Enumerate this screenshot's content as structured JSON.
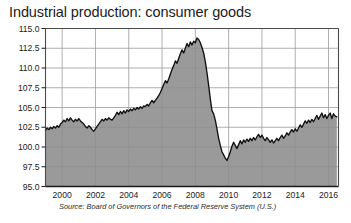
{
  "chart_data": {
    "type": "area",
    "title": "Industrial production: consumer goods",
    "xlabel": "",
    "ylabel": "",
    "source": "Source: Board of Governors of the Federal Reserve System (U.S.)",
    "grid": true,
    "legend": "none",
    "xlim": [
      1999.0,
      2016.6
    ],
    "ylim": [
      95.0,
      115.0
    ],
    "yticks": [
      "95.0",
      "97.5",
      "100.0",
      "102.5",
      "105.0",
      "107.5",
      "110.0",
      "112.5",
      "115.0"
    ],
    "ytick_values": [
      95.0,
      97.5,
      100.0,
      102.5,
      105.0,
      107.5,
      110.0,
      112.5,
      115.0
    ],
    "xticks": [
      "2000",
      "2002",
      "2004",
      "2006",
      "2008",
      "2010",
      "2012",
      "2014",
      "2016"
    ],
    "xtick_values": [
      2000,
      2002,
      2004,
      2006,
      2008,
      2010,
      2012,
      2014,
      2016
    ],
    "colors": {
      "area_fill": "#8c8c8c",
      "line": "#101010",
      "grid": "#9a9a9a",
      "axis": "#4a4a4a",
      "background": "#ffffff",
      "title_text": "#1c1c1c"
    },
    "series": [
      {
        "name": "Industrial production: consumer goods",
        "x": [
          1999.0,
          1999.1,
          1999.2,
          1999.3,
          1999.4,
          1999.5,
          1999.6,
          1999.7,
          1999.8,
          1999.9,
          2000.0,
          2000.1,
          2000.2,
          2000.3,
          2000.4,
          2000.5,
          2000.6,
          2000.7,
          2000.8,
          2000.9,
          2001.0,
          2001.1,
          2001.2,
          2001.3,
          2001.4,
          2001.5,
          2001.6,
          2001.7,
          2001.8,
          2001.9,
          2002.0,
          2002.1,
          2002.2,
          2002.3,
          2002.4,
          2002.5,
          2002.6,
          2002.7,
          2002.8,
          2002.9,
          2003.0,
          2003.1,
          2003.2,
          2003.3,
          2003.4,
          2003.5,
          2003.6,
          2003.7,
          2003.8,
          2003.9,
          2004.0,
          2004.1,
          2004.2,
          2004.3,
          2004.4,
          2004.5,
          2004.6,
          2004.7,
          2004.8,
          2004.9,
          2005.0,
          2005.1,
          2005.2,
          2005.3,
          2005.4,
          2005.5,
          2005.6,
          2005.7,
          2005.8,
          2005.9,
          2006.0,
          2006.1,
          2006.2,
          2006.3,
          2006.4,
          2006.5,
          2006.6,
          2006.7,
          2006.8,
          2006.9,
          2007.0,
          2007.1,
          2007.2,
          2007.3,
          2007.4,
          2007.5,
          2007.6,
          2007.7,
          2007.8,
          2007.9,
          2008.0,
          2008.1,
          2008.2,
          2008.3,
          2008.4,
          2008.5,
          2008.6,
          2008.7,
          2008.8,
          2008.9,
          2009.0,
          2009.1,
          2009.2,
          2009.3,
          2009.4,
          2009.5,
          2009.6,
          2009.7,
          2009.8,
          2009.9,
          2010.0,
          2010.1,
          2010.2,
          2010.3,
          2010.4,
          2010.5,
          2010.6,
          2010.7,
          2010.8,
          2010.9,
          2011.0,
          2011.1,
          2011.2,
          2011.3,
          2011.4,
          2011.5,
          2011.6,
          2011.7,
          2011.8,
          2011.9,
          2012.0,
          2012.1,
          2012.2,
          2012.3,
          2012.4,
          2012.5,
          2012.6,
          2012.7,
          2012.8,
          2012.9,
          2013.0,
          2013.1,
          2013.2,
          2013.3,
          2013.4,
          2013.5,
          2013.6,
          2013.7,
          2013.8,
          2013.9,
          2014.0,
          2014.1,
          2014.2,
          2014.3,
          2014.4,
          2014.5,
          2014.6,
          2014.7,
          2014.8,
          2014.9,
          2015.0,
          2015.1,
          2015.2,
          2015.3,
          2015.4,
          2015.5,
          2015.6,
          2015.7,
          2015.8,
          2015.9,
          2016.0,
          2016.1,
          2016.2,
          2016.3,
          2016.4,
          2016.5
        ],
        "y": [
          102.1,
          102.4,
          102.2,
          102.5,
          102.3,
          102.6,
          102.4,
          102.7,
          102.5,
          102.9,
          103.1,
          103.4,
          103.2,
          103.6,
          103.3,
          103.7,
          103.4,
          103.2,
          103.5,
          103.3,
          103.6,
          103.3,
          103.1,
          102.9,
          102.6,
          102.4,
          102.7,
          102.5,
          102.2,
          102.0,
          102.3,
          102.6,
          102.9,
          103.2,
          103.5,
          103.3,
          103.6,
          103.4,
          103.7,
          103.5,
          103.4,
          103.7,
          104.0,
          104.4,
          104.1,
          104.5,
          104.2,
          104.6,
          104.3,
          104.7,
          104.5,
          104.8,
          104.6,
          104.9,
          104.7,
          105.0,
          104.8,
          105.1,
          104.9,
          105.2,
          105.1,
          105.4,
          105.2,
          105.6,
          105.9,
          105.6,
          105.9,
          106.2,
          106.5,
          106.9,
          107.4,
          107.9,
          108.4,
          108.1,
          108.6,
          109.2,
          109.8,
          110.3,
          110.9,
          110.6,
          111.2,
          111.8,
          112.3,
          111.9,
          112.5,
          113.1,
          112.7,
          113.3,
          112.9,
          113.4,
          113.2,
          113.8,
          113.6,
          113.2,
          112.6,
          111.9,
          110.8,
          109.4,
          107.8,
          106.1,
          104.6,
          104.2,
          103.4,
          102.3,
          101.1,
          100.2,
          99.4,
          99.0,
          98.6,
          98.3,
          98.8,
          99.4,
          100.1,
          100.6,
          100.2,
          99.8,
          100.3,
          100.8,
          100.4,
          100.9,
          100.6,
          101.0,
          100.7,
          101.1,
          100.8,
          101.2,
          100.9,
          101.3,
          101.6,
          101.2,
          101.5,
          101.1,
          100.8,
          101.2,
          100.9,
          100.6,
          100.9,
          100.5,
          100.8,
          101.1,
          100.8,
          101.2,
          101.5,
          101.1,
          101.4,
          101.8,
          101.5,
          101.9,
          102.2,
          101.9,
          102.3,
          102.0,
          102.4,
          102.8,
          102.5,
          102.9,
          103.3,
          103.0,
          103.4,
          103.1,
          103.5,
          103.2,
          103.6,
          104.0,
          103.5,
          103.9,
          104.3,
          103.7,
          104.1,
          103.6,
          104.0,
          104.3,
          103.6,
          104.2,
          103.9,
          103.8
        ]
      }
    ]
  }
}
